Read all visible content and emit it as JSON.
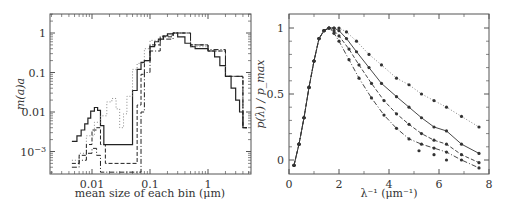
{
  "chart_data": [
    {
      "type": "line",
      "subtype": "step",
      "xscale": "log",
      "yscale": "log",
      "xlabel": "mean size of each bin (μm)",
      "ylabel": "m(a)a",
      "xlim": [
        0.004,
        6
      ],
      "ylim": [
        0.0003,
        2.5
      ],
      "xticks": [
        "0.01",
        "0.1",
        "1"
      ],
      "yticks": [
        "1",
        "0.1",
        "0.01",
        "10⁻³"
      ],
      "series": [
        {
          "name": "solid",
          "style": "solid",
          "x": [
            0.0045,
            0.0055,
            0.0065,
            0.0075,
            0.0085,
            0.0095,
            0.011,
            0.0125,
            0.014,
            0.016,
            0.05,
            0.06,
            0.07,
            0.08,
            0.1,
            0.12,
            0.14,
            0.17,
            0.2,
            0.25,
            0.3,
            0.4,
            0.5,
            0.6,
            0.8,
            1.0,
            1.3,
            1.6,
            2.0,
            2.5,
            3.0,
            3.5,
            4.0
          ],
          "values": [
            0.0018,
            0.0025,
            0.0035,
            0.005,
            0.007,
            0.0105,
            0.013,
            0.011,
            0.0045,
            0.0015,
            0.035,
            0.12,
            0.18,
            0.2,
            0.45,
            0.6,
            0.7,
            0.85,
            0.95,
            1.0,
            0.8,
            0.55,
            0.45,
            0.4,
            0.4,
            0.35,
            0.25,
            0.15,
            0.08,
            0.04,
            0.02,
            0.01,
            0.004
          ]
        },
        {
          "name": "dotted",
          "style": "dotted",
          "x": [
            0.0045,
            0.006,
            0.008,
            0.011,
            0.014,
            0.018,
            0.022,
            0.026,
            0.03,
            0.035,
            0.04,
            0.05,
            0.06,
            0.08,
            0.1,
            0.15,
            0.25,
            0.5,
            1.0,
            2.0,
            4.0
          ],
          "values": [
            0.0006,
            0.0009,
            0.0025,
            0.0055,
            0.008,
            0.018,
            0.022,
            0.012,
            0.004,
            0.009,
            0.025,
            0.12,
            0.17,
            0.4,
            0.65,
            0.85,
            1.0,
            0.45,
            0.35,
            0.08,
            0.004
          ]
        },
        {
          "name": "dashed",
          "style": "dashed",
          "x": [
            0.0045,
            0.006,
            0.008,
            0.01,
            0.012,
            0.014,
            0.017,
            0.06,
            0.07,
            0.08,
            0.1,
            0.15,
            0.25,
            0.5,
            1.0,
            2.0,
            4.0
          ],
          "values": [
            0.0005,
            0.0008,
            0.0015,
            0.0035,
            0.004,
            0.0015,
            0.0005,
            0.015,
            0.09,
            0.2,
            0.5,
            0.8,
            1.0,
            0.5,
            0.35,
            0.08,
            0.004
          ]
        },
        {
          "name": "dash-dot",
          "style": "dash-dot",
          "x": [
            0.0045,
            0.006,
            0.008,
            0.01,
            0.012,
            0.014,
            0.07,
            0.08,
            0.1,
            0.15,
            0.25,
            0.5,
            1.0,
            2.0,
            4.0
          ],
          "values": [
            0.0004,
            0.0006,
            0.0009,
            0.0012,
            0.0008,
            0.0003,
            0.01,
            0.1,
            0.35,
            0.7,
            1.0,
            0.5,
            0.38,
            0.08,
            0.004
          ]
        }
      ]
    },
    {
      "type": "line",
      "subtype": "line-with-markers",
      "xlabel": "λ⁻¹ (μm⁻¹)",
      "ylabel": "p(λ) / p_max",
      "xlim": [
        0,
        8
      ],
      "ylim": [
        -0.1,
        1.1
      ],
      "xticks": [
        "0",
        "2",
        "4",
        "6",
        "8"
      ],
      "yticks": [
        "0",
        "0.5",
        "1"
      ],
      "series": [
        {
          "name": "dotted",
          "style": "dotted",
          "x": [
            0.2,
            0.4,
            0.6,
            0.8,
            1.0,
            1.2,
            1.4,
            1.6,
            1.8,
            2.0,
            2.3,
            2.7,
            3.2,
            3.7,
            4.3,
            4.8,
            5.3,
            5.8,
            6.3,
            6.9,
            7.6
          ],
          "values": [
            -0.04,
            0.12,
            0.32,
            0.55,
            0.75,
            0.92,
            0.98,
            1.0,
            1.0,
            1.0,
            0.97,
            0.9,
            0.8,
            0.72,
            0.62,
            0.57,
            0.5,
            0.45,
            0.4,
            0.33,
            0.25
          ]
        },
        {
          "name": "solid",
          "style": "solid",
          "x": [
            0.2,
            0.4,
            0.6,
            0.8,
            1.0,
            1.2,
            1.4,
            1.6,
            1.8,
            2.0,
            2.3,
            2.7,
            3.2,
            3.7,
            4.3,
            4.8,
            5.3,
            5.8,
            6.3,
            6.9,
            7.6
          ],
          "values": [
            -0.04,
            0.12,
            0.32,
            0.55,
            0.75,
            0.92,
            0.98,
            1.0,
            1.0,
            0.98,
            0.92,
            0.82,
            0.7,
            0.58,
            0.48,
            0.4,
            0.32,
            0.25,
            0.22,
            0.12,
            0.05
          ]
        },
        {
          "name": "dashed",
          "style": "dashed",
          "x": [
            0.2,
            0.4,
            0.6,
            0.8,
            1.0,
            1.2,
            1.4,
            1.6,
            1.8,
            2.0,
            2.4,
            2.8,
            3.3,
            3.8,
            4.3,
            4.8,
            5.3,
            5.8,
            6.3,
            6.9,
            7.6
          ],
          "values": [
            -0.04,
            0.12,
            0.32,
            0.55,
            0.75,
            0.92,
            0.98,
            1.0,
            0.98,
            0.94,
            0.84,
            0.72,
            0.58,
            0.45,
            0.35,
            0.27,
            0.2,
            0.15,
            0.12,
            0.04,
            -0.02
          ]
        },
        {
          "name": "dash-dot",
          "style": "dash-dot",
          "x": [
            0.2,
            0.4,
            0.6,
            0.8,
            1.0,
            1.2,
            1.4,
            1.6,
            1.8,
            2.0,
            2.4,
            2.8,
            3.3,
            3.8,
            4.3,
            4.8,
            5.3,
            5.8,
            6.3,
            6.9,
            7.6
          ],
          "values": [
            -0.04,
            0.12,
            0.32,
            0.55,
            0.75,
            0.92,
            0.98,
            1.0,
            0.96,
            0.9,
            0.76,
            0.62,
            0.47,
            0.34,
            0.24,
            0.16,
            0.12,
            0.09,
            0.06,
            0.0,
            -0.06
          ]
        }
      ],
      "markers_only": {
        "x": [
          5.2,
          5.8,
          6.3
        ],
        "values": [
          0.07,
          0.04,
          0.0
        ]
      }
    }
  ]
}
